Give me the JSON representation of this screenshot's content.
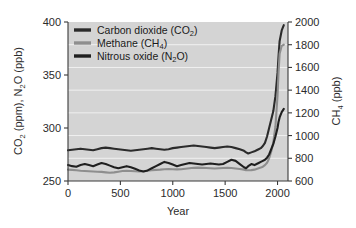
{
  "chart_data": {
    "type": "line",
    "title": "",
    "xlabel": "Year",
    "ylabel_left": "CO2 (ppm), N2O (ppb)",
    "ylabel_right": "CH4 (ppb)",
    "xlim": [
      0,
      2100
    ],
    "ylim_left": [
      250,
      400
    ],
    "ylim_right": [
      600,
      2000
    ],
    "grid": true,
    "legend_position": "top-left",
    "xticks": [
      0,
      500,
      1000,
      1500,
      2000
    ],
    "yticks_left": [
      250,
      300,
      350,
      400
    ],
    "yticks_right": [
      600,
      800,
      1000,
      1200,
      1400,
      1600,
      1800,
      2000
    ],
    "series": [
      {
        "name": "Carbon dioxide (CO2)",
        "legend_text_main": "Carbon dioxide (CO",
        "legend_sub": "2",
        "legend_text_tail": ")",
        "axis": "left",
        "color": "#2b2b2b",
        "width": 2.1,
        "x": [
          0,
          40,
          80,
          120,
          160,
          200,
          240,
          280,
          320,
          360,
          400,
          440,
          480,
          520,
          560,
          600,
          640,
          680,
          720,
          760,
          800,
          840,
          880,
          920,
          960,
          1000,
          1040,
          1080,
          1120,
          1160,
          1200,
          1240,
          1280,
          1320,
          1360,
          1400,
          1440,
          1480,
          1520,
          1560,
          1600,
          1640,
          1680,
          1700,
          1720,
          1750,
          1780,
          1800,
          1820,
          1840,
          1860,
          1880,
          1900,
          1920,
          1940,
          1960,
          1980,
          2000,
          2010,
          2020,
          2040,
          2060
        ],
        "values": [
          279,
          279.5,
          280,
          280.5,
          280,
          279.5,
          279,
          280,
          281,
          281.5,
          281,
          280.5,
          280,
          279.5,
          279,
          278.5,
          279,
          279.5,
          280,
          280.5,
          281,
          280.5,
          280,
          279.5,
          280,
          281,
          281.5,
          282,
          282.5,
          283,
          283.5,
          283,
          282.5,
          282,
          281.5,
          281,
          281.5,
          282,
          282.5,
          282,
          281,
          280,
          278.5,
          277,
          276,
          277,
          278,
          279,
          280,
          281,
          283,
          286,
          292,
          300,
          308,
          316,
          330,
          352,
          368,
          382,
          392,
          397
        ]
      },
      {
        "name": "Methane (CH4)",
        "legend_text_main": "Methane (CH",
        "legend_sub": "4",
        "legend_text_tail": ")",
        "axis": "right",
        "color": "#8e8e8e",
        "width": 2.1,
        "x": [
          0,
          40,
          80,
          120,
          160,
          200,
          240,
          280,
          320,
          360,
          400,
          440,
          480,
          520,
          560,
          600,
          640,
          680,
          720,
          760,
          800,
          840,
          880,
          920,
          960,
          1000,
          1040,
          1080,
          1120,
          1160,
          1200,
          1240,
          1280,
          1320,
          1360,
          1400,
          1440,
          1480,
          1520,
          1560,
          1600,
          1640,
          1680,
          1700,
          1720,
          1750,
          1780,
          1800,
          1820,
          1840,
          1860,
          1880,
          1900,
          1920,
          1940,
          1960,
          1980,
          2000,
          2010,
          2020,
          2040,
          2060
        ],
        "values": [
          700,
          698,
          694,
          690,
          688,
          686,
          684,
          682,
          680,
          676,
          672,
          676,
          682,
          688,
          690,
          688,
          686,
          684,
          686,
          690,
          694,
          698,
          700,
          704,
          706,
          704,
          702,
          704,
          708,
          712,
          716,
          718,
          716,
          714,
          712,
          710,
          712,
          714,
          716,
          714,
          710,
          706,
          700,
          696,
          694,
          696,
          700,
          706,
          712,
          718,
          726,
          740,
          760,
          800,
          860,
          940,
          1080,
          1350,
          1560,
          1720,
          1790,
          1800
        ]
      },
      {
        "name": "Nitrous oxide (N2O)",
        "legend_text_main": "Nitrous oxide (N",
        "legend_sub": "2",
        "legend_text_tail": "O)",
        "axis": "left",
        "color": "#1f1f1f",
        "width": 2.1,
        "x": [
          0,
          40,
          80,
          120,
          160,
          200,
          240,
          280,
          320,
          360,
          400,
          440,
          480,
          520,
          560,
          600,
          640,
          680,
          720,
          760,
          800,
          840,
          880,
          920,
          960,
          1000,
          1040,
          1080,
          1120,
          1160,
          1200,
          1240,
          1280,
          1320,
          1360,
          1400,
          1440,
          1480,
          1520,
          1560,
          1600,
          1640,
          1680,
          1700,
          1720,
          1750,
          1780,
          1800,
          1820,
          1840,
          1860,
          1880,
          1900,
          1920,
          1940,
          1960,
          1980,
          2000,
          2010,
          2020,
          2040,
          2060
        ],
        "values": [
          265,
          264,
          263.5,
          265,
          266,
          265,
          264,
          265.5,
          267,
          266,
          264.5,
          263,
          262,
          263,
          264,
          263,
          261.5,
          260,
          259,
          260,
          262,
          264,
          266,
          268,
          267,
          265.5,
          264,
          265,
          266,
          267,
          266.5,
          266,
          265.5,
          266,
          266.5,
          266,
          265.5,
          266,
          268,
          270,
          269,
          266,
          263,
          262,
          264,
          266,
          265,
          266,
          267,
          268,
          269,
          270,
          272,
          275,
          280,
          285,
          292,
          300,
          306,
          310,
          315,
          318
        ]
      }
    ]
  },
  "legend": {
    "entries": [
      {
        "label": "Carbon dioxide (CO2)",
        "color": "#2b2b2b"
      },
      {
        "label": "Methane (CH4)",
        "color": "#8e8e8e"
      },
      {
        "label": "Nitrous oxide (N2O)",
        "color": "#1f1f1f"
      }
    ]
  },
  "axes": {
    "left_title_parts": [
      "CO",
      "2",
      " (ppm), N",
      "2",
      "O (ppb)"
    ],
    "right_title_parts": [
      "CH",
      "4",
      " (ppb)"
    ],
    "x_title": "Year"
  },
  "colors": {
    "plot_background": "#d4d4d4",
    "page_background": "#ffffff",
    "axis": "#3a3a3a",
    "gridline": "#ffffff",
    "co2": "#2b2b2b",
    "ch4": "#8e8e8e",
    "n2o": "#1f1f1f"
  }
}
